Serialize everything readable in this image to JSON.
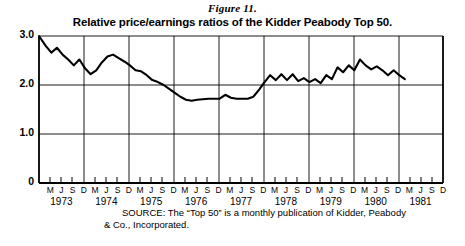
{
  "figure": {
    "number": "Figure 11.",
    "title": "Relative price/earnings ratios of the Kidder Peabody Top 50.",
    "source_line1": "SOURCE: The “Top 50” is a monthly publication of Kidder, Peabody",
    "source_line2": "& Co., Incorporated."
  },
  "chart_data": {
    "type": "line",
    "title": "Relative price/earnings ratios of the Kidder Peabody Top 50.",
    "xlabel": "",
    "ylabel": "",
    "ylim": [
      0,
      3.0
    ],
    "yticks": [
      0,
      1.0,
      2.0,
      3.0
    ],
    "ytick_labels": [
      "0",
      "1.0",
      "2.0",
      "3.0"
    ],
    "grid": true,
    "grid_horizontal_at": [
      1.0,
      2.0,
      3.0
    ],
    "grid_vertical_at_years": [
      "1973",
      "1974",
      "1975",
      "1976",
      "1977",
      "1978",
      "1979",
      "1980",
      "1981"
    ],
    "legend": "none",
    "line_color": "#000000",
    "years": [
      "1973",
      "1974",
      "1975",
      "1976",
      "1977",
      "1978",
      "1979",
      "1980",
      "1981"
    ],
    "month_tick_labels": [
      "M",
      "J",
      "S",
      "D"
    ],
    "x": [
      "1973-03",
      "1973-06",
      "1973-09",
      "1973-12",
      "1974-03",
      "1974-06",
      "1974-09",
      "1974-12",
      "1975-03",
      "1975-06",
      "1975-09",
      "1975-12",
      "1976-03",
      "1976-06",
      "1976-09",
      "1976-12",
      "1977-03",
      "1977-06",
      "1977-09",
      "1977-12",
      "1978-03",
      "1978-06",
      "1978-09",
      "1978-12",
      "1979-03",
      "1979-06",
      "1979-09",
      "1979-12",
      "1980-03",
      "1980-06",
      "1980-09",
      "1980-12",
      "1981-03",
      "1981-06",
      "1981-09",
      "1981-12"
    ],
    "values": [
      3.0,
      2.72,
      2.6,
      2.72,
      2.55,
      2.4,
      2.52,
      2.3,
      2.42,
      2.57,
      2.62,
      2.52,
      2.38,
      2.3,
      2.22,
      2.08,
      2.05,
      1.92,
      1.82,
      1.73,
      1.68,
      1.7,
      1.7,
      1.72,
      1.72,
      1.8,
      1.72,
      1.72,
      1.95,
      2.22,
      2.1,
      2.22,
      2.36,
      2.52,
      2.3,
      2.12
    ],
    "series_detail_points": [
      [
        0.0,
        3.0
      ],
      [
        0.3,
        2.8
      ],
      [
        0.55,
        2.66
      ],
      [
        0.8,
        2.76
      ],
      [
        1.05,
        2.62
      ],
      [
        1.3,
        2.52
      ],
      [
        1.55,
        2.4
      ],
      [
        1.8,
        2.52
      ],
      [
        2.05,
        2.34
      ],
      [
        2.3,
        2.22
      ],
      [
        2.55,
        2.3
      ],
      [
        2.8,
        2.46
      ],
      [
        3.05,
        2.58
      ],
      [
        3.3,
        2.62
      ],
      [
        3.55,
        2.55
      ],
      [
        3.8,
        2.48
      ],
      [
        4.05,
        2.4
      ],
      [
        4.3,
        2.3
      ],
      [
        4.55,
        2.28
      ],
      [
        4.8,
        2.2
      ],
      [
        5.05,
        2.1
      ],
      [
        5.3,
        2.06
      ],
      [
        5.55,
        2.0
      ],
      [
        5.8,
        1.92
      ],
      [
        6.05,
        1.84
      ],
      [
        6.3,
        1.76
      ],
      [
        6.55,
        1.7
      ],
      [
        6.8,
        1.68
      ],
      [
        7.05,
        1.7
      ],
      [
        7.3,
        1.71
      ],
      [
        7.55,
        1.72
      ],
      [
        7.8,
        1.72
      ],
      [
        8.05,
        1.72
      ],
      [
        8.3,
        1.8
      ],
      [
        8.55,
        1.74
      ],
      [
        8.8,
        1.72
      ],
      [
        9.05,
        1.72
      ],
      [
        9.3,
        1.72
      ],
      [
        9.55,
        1.76
      ],
      [
        9.8,
        1.9
      ],
      [
        10.05,
        2.06
      ],
      [
        10.3,
        2.2
      ],
      [
        10.55,
        2.1
      ],
      [
        10.8,
        2.22
      ],
      [
        11.05,
        2.1
      ],
      [
        11.3,
        2.22
      ],
      [
        11.55,
        2.08
      ],
      [
        11.8,
        2.14
      ],
      [
        12.05,
        2.06
      ],
      [
        12.3,
        2.12
      ],
      [
        12.55,
        2.04
      ],
      [
        12.8,
        2.2
      ],
      [
        13.05,
        2.12
      ],
      [
        13.3,
        2.36
      ],
      [
        13.55,
        2.26
      ],
      [
        13.8,
        2.4
      ],
      [
        14.05,
        2.3
      ],
      [
        14.3,
        2.52
      ],
      [
        14.55,
        2.4
      ],
      [
        14.8,
        2.32
      ],
      [
        15.05,
        2.38
      ],
      [
        15.3,
        2.3
      ],
      [
        15.55,
        2.2
      ],
      [
        15.8,
        2.3
      ],
      [
        16.05,
        2.2
      ],
      [
        16.3,
        2.12
      ]
    ],
    "annotations": {
      "start_value": 3.0,
      "minimum_value": 1.68,
      "maximum_value": 3.0,
      "end_value": 2.12
    }
  },
  "axis": {
    "y_labels": [
      {
        "text": "3.0",
        "value": 3.0
      },
      {
        "text": "2.0",
        "value": 2.0
      },
      {
        "text": "1.0",
        "value": 1.0
      },
      {
        "text": "0",
        "value": 0
      }
    ],
    "x_month_labels": [
      "M",
      "J",
      "S",
      "D"
    ],
    "x_year_labels": [
      "1973",
      "1974",
      "1975",
      "1976",
      "1977",
      "1978",
      "1979",
      "1980",
      "1981"
    ]
  }
}
